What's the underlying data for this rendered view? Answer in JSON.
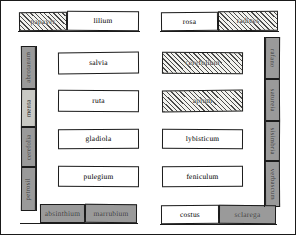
{
  "plan": {
    "title": "monastic herb garden plan",
    "colors": {
      "ink": "#1b1b1b",
      "paper": "#ffffff",
      "grey_fill": "#9a9a9a",
      "grey_light_fill": "#c9c9c4",
      "hatch_line": "#4a4a4a"
    },
    "top_row": [
      {
        "label": "papaver",
        "fill": "hatch"
      },
      {
        "label": "lilium",
        "fill": "white"
      },
      {
        "label": "rosa",
        "fill": "white"
      },
      {
        "label": "radices",
        "fill": "hatch"
      }
    ],
    "left_column": [
      {
        "label": "abrotanum",
        "fill": "grey"
      },
      {
        "label": "menta",
        "fill": "grey-light"
      },
      {
        "label": "cerefolia",
        "fill": "grey"
      },
      {
        "label": "petrosil",
        "fill": "grey"
      }
    ],
    "right_column": [
      {
        "label": "rafano",
        "fill": "grey"
      },
      {
        "label": "satureia",
        "fill": "grey"
      },
      {
        "label": "sisimbria",
        "fill": "grey"
      },
      {
        "label": "verbascum",
        "fill": "grey"
      }
    ],
    "center_beds": [
      {
        "label": "salvia",
        "fill": "white",
        "row": 1,
        "col": "left"
      },
      {
        "label": "cerefolium",
        "fill": "hatch",
        "row": 1,
        "col": "right"
      },
      {
        "label": "ruta",
        "fill": "white",
        "row": 2,
        "col": "left"
      },
      {
        "label": "apium",
        "fill": "hatch",
        "row": 2,
        "col": "right"
      },
      {
        "label": "gladiola",
        "fill": "white",
        "row": 3,
        "col": "left"
      },
      {
        "label": "lybisticum",
        "fill": "white",
        "row": 3,
        "col": "right"
      },
      {
        "label": "pulegium",
        "fill": "white",
        "row": 4,
        "col": "left"
      },
      {
        "label": "feniculum",
        "fill": "white",
        "row": 4,
        "col": "right"
      }
    ],
    "bottom_row": [
      {
        "label": "absinthium",
        "fill": "grey"
      },
      {
        "label": "marrubium",
        "fill": "grey"
      },
      {
        "label": "costus",
        "fill": "white"
      },
      {
        "label": "sclarega",
        "fill": "grey"
      }
    ]
  }
}
